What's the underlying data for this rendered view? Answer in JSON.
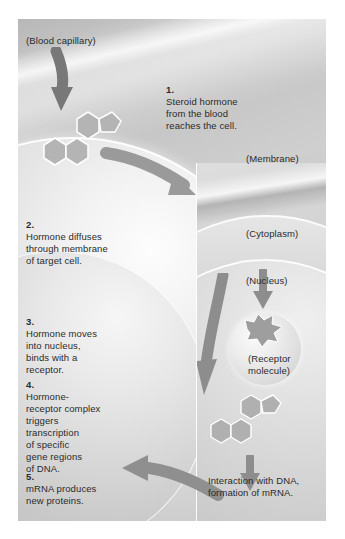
{
  "figure": {
    "background_color": "#bdbdbd",
    "text_color": "#2b2b2b",
    "structure_labels": [
      {
        "id": "blood-capillary",
        "text": "(Blood capillary)"
      },
      {
        "id": "membrane",
        "text": "(Membrane)"
      },
      {
        "id": "cytoplasm",
        "text": "(Cytoplasm)"
      },
      {
        "id": "nucleus",
        "text": "(Nucleus)"
      },
      {
        "id": "receptor-molecule",
        "text": "(Receptor\nmolecule)"
      }
    ],
    "steps": [
      {
        "number": "1.",
        "text": "Steroid hormone\nfrom the blood\nreaches the cell."
      },
      {
        "number": "2.",
        "text": "Hormone diffuses\nthrough membrane\nof target cell."
      },
      {
        "number": "3.",
        "text": "Hormone moves\ninto nucleus,\nbinds with a\nreceptor."
      },
      {
        "number": "4.",
        "text": "Hormone-\nreceptor complex\ntriggers\ntranscription\nof specific\ngene regions\nof DNA."
      },
      {
        "number": "5.",
        "text": "mRNA produces\nnew proteins."
      }
    ],
    "captions": [
      {
        "id": "dna-interaction",
        "text": "Interaction with DNA,\nformation of mRNA."
      }
    ],
    "molecules": [
      {
        "id": "steroid-hormone-extracellular",
        "name": "steroid-hormone-molecule"
      },
      {
        "id": "steroid-hormone-in-nucleus",
        "name": "steroid-hormone-molecule"
      }
    ],
    "arrows": [
      {
        "id": "arrow-capillary-to-hormone",
        "direction": "down"
      },
      {
        "id": "arrow-hormone-into-membrane",
        "direction": "down-right"
      },
      {
        "id": "arrow-into-nucleus",
        "direction": "down"
      },
      {
        "id": "arrow-receptor-binding",
        "direction": "down"
      },
      {
        "id": "arrow-to-dna",
        "direction": "down"
      },
      {
        "id": "arrow-mrna-out",
        "direction": "left"
      }
    ]
  }
}
